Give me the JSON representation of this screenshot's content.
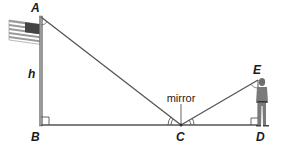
{
  "diagram": {
    "points": {
      "A": {
        "label": "A",
        "x": 41,
        "y": 17
      },
      "B": {
        "label": "B",
        "x": 41,
        "y": 125
      },
      "C": {
        "label": "C",
        "x": 181,
        "y": 125
      },
      "D": {
        "label": "D",
        "x": 259,
        "y": 125
      },
      "E": {
        "label": "E",
        "x": 258,
        "y": 80
      }
    },
    "labels": {
      "height": "h",
      "mirror": "mirror"
    },
    "colors": {
      "line": "#555555",
      "pole": "#888888",
      "text": "#1a1a1a",
      "figure": "#777777"
    }
  }
}
